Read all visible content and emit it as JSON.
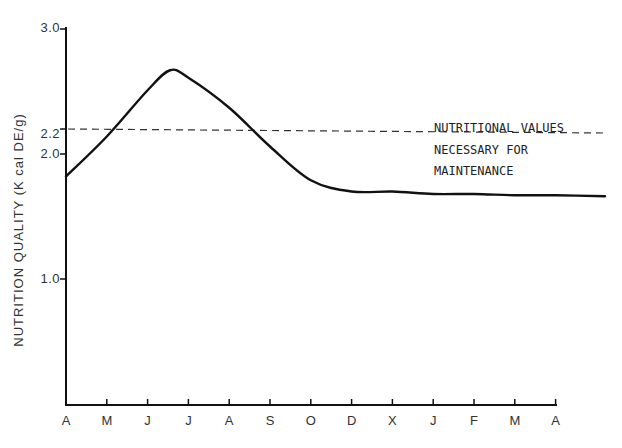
{
  "chart_data": {
    "type": "line",
    "title": "",
    "xlabel": "",
    "ylabel": "NUTRITION QUALITY (K cal DE/g)",
    "x": [
      "A",
      "M",
      "J",
      "J",
      "A",
      "S",
      "O",
      "D",
      "X",
      "J",
      "F",
      "M",
      "A"
    ],
    "ylim": [
      0,
      3.0
    ],
    "yticks": [
      "3.0",
      "2.2",
      "2.0",
      "1.0"
    ],
    "ytick_values": [
      3.0,
      2.2,
      2.0,
      1.0
    ],
    "grid": false,
    "series": [
      {
        "name": "Nutrition quality",
        "style": "solid",
        "values": [
          1.82,
          2.14,
          2.51,
          2.61,
          2.37,
          2.06,
          1.79,
          1.7,
          1.7,
          1.68,
          1.68,
          1.67,
          1.67
        ],
        "peak": {
          "x_between": "J-J",
          "value": 2.67
        }
      },
      {
        "name": "Nutritional values necessary for maintenance",
        "style": "dashed",
        "values": [
          2.2,
          2.2,
          2.2,
          2.2,
          2.2,
          2.2,
          2.2,
          2.2,
          2.2,
          2.2,
          2.2,
          2.2,
          2.2
        ]
      }
    ],
    "annotations": [
      "NUTRITIONAL VALUES",
      "NECESSARY FOR",
      "MAINTENANCE"
    ]
  }
}
